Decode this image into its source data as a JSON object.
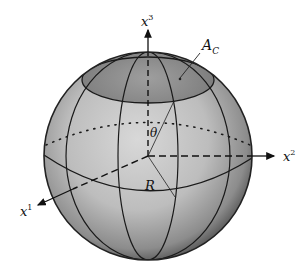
{
  "figure": {
    "type": "sphere-diagram",
    "labels": {
      "x1": "x",
      "x1_sup": "1",
      "x2": "x",
      "x2_sup": "2",
      "x3": "x",
      "x3_sup": "3",
      "cap_area": "A",
      "cap_area_sub": "C",
      "angle": "θ",
      "radius": "R"
    },
    "colors": {
      "sphere_light": "#d4d4d4",
      "sphere_dark": "#5a5a5a",
      "cap_fill": "#8a8a8a",
      "line": "#1a1a1a"
    }
  }
}
